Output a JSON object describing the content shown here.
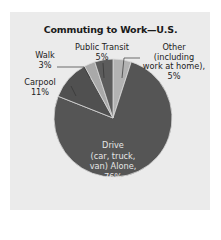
{
  "chart_data": {
    "type": "pie",
    "title": "Commuting to Work—U.S.",
    "slices": [
      {
        "label": "Drive (car, truck, van) Alone",
        "value": 76,
        "color": "#555555"
      },
      {
        "label": "Carpool",
        "value": 11,
        "color": "#505050"
      },
      {
        "label": "Walk",
        "value": 3,
        "color": "#a9a9a9"
      },
      {
        "label": "Public Transit",
        "value": 5,
        "color": "#5c5c5c"
      },
      {
        "label": "Other (including work at home)",
        "value": 5,
        "color": "#b3b3b3"
      }
    ],
    "unit": "%"
  },
  "labels": {
    "title": "Commuting to Work—U.S.",
    "public_transit": "Public Transit",
    "public_transit_pct": "5%",
    "walk": "Walk",
    "walk_pct": "3%",
    "carpool": "Carpool",
    "carpool_pct": "11%",
    "other_1": "Other",
    "other_2": "(including",
    "other_3": "work at home),",
    "other_4": "5%",
    "drive_1": "Drive",
    "drive_2": "(car, truck,",
    "drive_3": "van) Alone,",
    "drive_4": "76%"
  }
}
